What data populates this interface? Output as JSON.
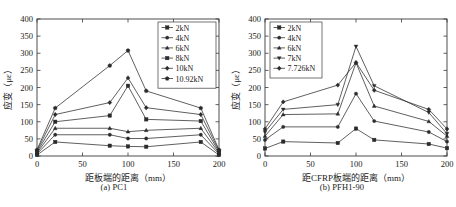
{
  "figure": {
    "panels": [
      {
        "caption": "(a) PC1",
        "xlabel": "距板端的距离（mm）",
        "ylabel": "应变（με）",
        "legend_position": "top-right"
      },
      {
        "caption": "(b) PFH1-90",
        "xlabel": "距CFRP板端的距离（mm）",
        "ylabel": "应变（με）",
        "legend_position": "top-left"
      }
    ]
  },
  "chart_data": [
    {
      "type": "line",
      "title": "(a) PC1",
      "xlabel": "距板端的距离（mm）",
      "ylabel": "应变（με）",
      "xlim": [
        0,
        200
      ],
      "ylim": [
        0,
        400
      ],
      "xticks": [
        0,
        50,
        100,
        150,
        200
      ],
      "yticks": [
        0,
        50,
        100,
        150,
        200,
        250,
        300,
        350,
        400
      ],
      "grid": false,
      "legend": [
        "2kN",
        "4kN",
        "6kN",
        "8kN",
        "10kN",
        "10.92kN"
      ],
      "x": [
        0,
        20,
        80,
        100,
        120,
        180,
        200
      ],
      "series": [
        {
          "name": "2kN",
          "marker": "square",
          "values": [
            3,
            41,
            30,
            28,
            27,
            41,
            3
          ]
        },
        {
          "name": "4kN",
          "marker": "circle",
          "values": [
            6,
            62,
            62,
            51,
            51,
            62,
            6
          ]
        },
        {
          "name": "6kN",
          "marker": "triangle",
          "values": [
            9,
            81,
            81,
            71,
            75,
            81,
            9
          ]
        },
        {
          "name": "8kN",
          "marker": "square",
          "values": [
            12,
            100,
            118,
            205,
            107,
            102,
            12
          ]
        },
        {
          "name": "10kN",
          "marker": "diamond",
          "values": [
            15,
            121,
            156,
            228,
            141,
            121,
            15
          ]
        },
        {
          "name": "10.92kN",
          "marker": "pentagon",
          "values": [
            18,
            140,
            264,
            308,
            190,
            140,
            18
          ]
        }
      ]
    },
    {
      "type": "line",
      "title": "(b) PFH1-90",
      "xlabel": "距CFRP板端的距离（mm）",
      "ylabel": "应变（με）",
      "xlim": [
        0,
        200
      ],
      "ylim": [
        0,
        400
      ],
      "xticks": [
        0,
        50,
        100,
        150,
        200
      ],
      "yticks": [
        0,
        50,
        100,
        150,
        200,
        250,
        300,
        350,
        400
      ],
      "grid": false,
      "legend": [
        "2kN",
        "4kN",
        "6kN",
        "7kN",
        "7.726kN"
      ],
      "x": [
        0,
        20,
        80,
        100,
        120,
        180,
        200
      ],
      "series": [
        {
          "name": "2kN",
          "marker": "square",
          "values": [
            22,
            42,
            38,
            80,
            47,
            35,
            23
          ]
        },
        {
          "name": "4kN",
          "marker": "circle",
          "values": [
            47,
            85,
            85,
            182,
            102,
            70,
            42
          ]
        },
        {
          "name": "6kN",
          "marker": "triangle",
          "values": [
            58,
            121,
            123,
            272,
            146,
            101,
            58
          ]
        },
        {
          "name": "7kN",
          "marker": "down-triangle",
          "values": [
            70,
            136,
            150,
            320,
            205,
            127,
            65
          ]
        },
        {
          "name": "7.726kN",
          "marker": "diamond",
          "values": [
            79,
            158,
            207,
            273,
            192,
            136,
            79
          ]
        }
      ]
    }
  ]
}
